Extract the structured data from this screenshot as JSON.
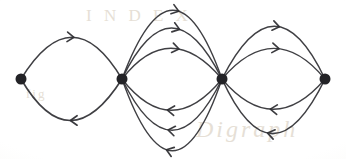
{
  "figure": {
    "kind": "hand-drawn-directed-multigraph",
    "background_color": "#fdfdfb",
    "ink_color": "#2f2f33",
    "width": 346,
    "height": 159,
    "ghost_text": {
      "line_1": "Digraph",
      "line_2": "I N D E X",
      "line_3": "fig"
    }
  },
  "graph": {
    "node_radius": 5.5,
    "node_color": "#232327",
    "stroke_width": 1.5,
    "nodes": [
      {
        "id": "v1",
        "label": "",
        "x": 21,
        "y": 79
      },
      {
        "id": "v2",
        "label": "",
        "x": 122,
        "y": 79
      },
      {
        "id": "v3",
        "label": "",
        "x": 222,
        "y": 79
      },
      {
        "id": "v4",
        "label": "",
        "x": 325,
        "y": 79
      }
    ],
    "edge_count_total": 12,
    "bundles": [
      {
        "id": "bundle-v1-v2",
        "from": "v1",
        "to": "v2",
        "edges_forward": 1,
        "edges_backward": 1,
        "total": 2
      },
      {
        "id": "bundle-v2-v3",
        "from": "v2",
        "to": "v3",
        "edges_forward": 3,
        "edges_backward": 3,
        "total": 6
      },
      {
        "id": "bundle-v3-v4",
        "from": "v3",
        "to": "v4",
        "edges_forward": 2,
        "edges_backward": 2,
        "total": 4
      }
    ],
    "edges": [
      {
        "id": "e1",
        "from": "v1",
        "to": "v2",
        "side": "top",
        "bow": -41,
        "arrow": "right",
        "arrow_t": 0.52
      },
      {
        "id": "e2",
        "from": "v2",
        "to": "v1",
        "side": "bottom",
        "bow": 42,
        "arrow": "left",
        "arrow_t": 0.5
      },
      {
        "id": "e3",
        "from": "v2",
        "to": "v3",
        "side": "top",
        "bow": -31,
        "arrow": "right",
        "arrow_t": 0.58
      },
      {
        "id": "e4",
        "from": "v2",
        "to": "v3",
        "side": "top",
        "bow": -51,
        "arrow": "right",
        "arrow_t": 0.58
      },
      {
        "id": "e5",
        "from": "v2",
        "to": "v3",
        "side": "top",
        "bow": -69,
        "arrow": "right",
        "arrow_t": 0.56
      },
      {
        "id": "e6",
        "from": "v3",
        "to": "v2",
        "side": "bottom",
        "bow": 31,
        "arrow": "left",
        "arrow_t": 0.46
      },
      {
        "id": "e7",
        "from": "v3",
        "to": "v2",
        "side": "bottom",
        "bow": 51,
        "arrow": "left",
        "arrow_t": 0.46
      },
      {
        "id": "e8",
        "from": "v3",
        "to": "v2",
        "side": "bottom",
        "bow": 71,
        "arrow": "left",
        "arrow_t": 0.44
      },
      {
        "id": "e9",
        "from": "v3",
        "to": "v4",
        "side": "top",
        "bow": -30,
        "arrow": "right",
        "arrow_t": 0.55
      },
      {
        "id": "e10",
        "from": "v3",
        "to": "v4",
        "side": "top",
        "bow": -53,
        "arrow": "right",
        "arrow_t": 0.55
      },
      {
        "id": "e11",
        "from": "v4",
        "to": "v3",
        "side": "bottom",
        "bow": 31,
        "arrow": "left",
        "arrow_t": 0.47
      },
      {
        "id": "e12",
        "from": "v4",
        "to": "v3",
        "side": "bottom",
        "bow": 55,
        "arrow": "left",
        "arrow_t": 0.45
      }
    ]
  }
}
